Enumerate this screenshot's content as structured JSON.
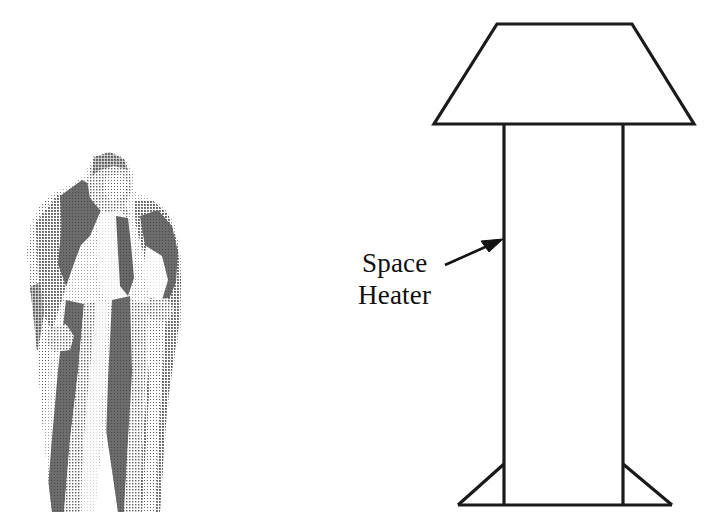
{
  "figure": {
    "background_color": "#ffffff",
    "line_color": "#1a1a1a",
    "width": 714,
    "height": 532
  },
  "annotation": {
    "label_line_1": "Space",
    "label_line_2": "Heater",
    "leader_arrow": {
      "tail_x": 445,
      "tail_y": 264,
      "tip_x": 503,
      "tip_y": 239,
      "points_to": "heater-column-left-edge"
    }
  },
  "heater": {
    "name": "Space Heater",
    "shade": {
      "shape": "trapezoid",
      "top_left_x": 497,
      "top_right_x": 632,
      "top_y": 24,
      "bottom_left_x": 434,
      "bottom_right_x": 694,
      "bottom_y": 124
    },
    "column": {
      "shape": "rectangle",
      "left_x": 504,
      "right_x": 623,
      "top_y": 124,
      "bottom_y": 505
    },
    "base": {
      "shape": "flared-trapezoid",
      "left_foot_x": 458,
      "right_foot_x": 672,
      "branch_y": 464,
      "bottom_y": 505
    }
  },
  "person": {
    "description": "Stylized halftone illustration of a standing man wearing a long open overcoat, suit, shirt and tie, hands on hips",
    "bounds": {
      "left": 25,
      "top": 155,
      "right": 185,
      "bottom": 512
    },
    "tones": {
      "darkest": "#1d1d1d",
      "dark": "#4a4a4a",
      "mid": "#7d7d7d",
      "light": "#b0b0b0",
      "lightest": "#d6d6d6",
      "highlight": "#f2f2f2"
    }
  }
}
